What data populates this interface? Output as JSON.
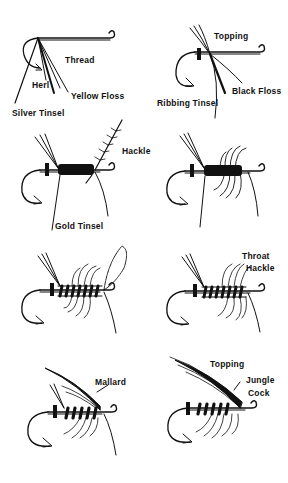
{
  "figure": {
    "ink_color": "#111111",
    "background": "#ffffff"
  },
  "panels": [
    {
      "step": 1,
      "labels": [
        {
          "id": "thread",
          "text": "Thread"
        },
        {
          "id": "herl",
          "text": "Herl"
        },
        {
          "id": "yellow-floss",
          "text": "Yellow Floss"
        },
        {
          "id": "silver-tinsel",
          "text": "Silver Tinsel"
        }
      ]
    },
    {
      "step": 2,
      "labels": [
        {
          "id": "topping",
          "text": "Topping"
        },
        {
          "id": "black-floss",
          "text": "Black Floss"
        },
        {
          "id": "ribbing-tinsel",
          "text": "Ribbing Tinsel"
        }
      ]
    },
    {
      "step": 3,
      "labels": [
        {
          "id": "hackle",
          "text": "Hackle"
        },
        {
          "id": "gold-tinsel",
          "text": "Gold Tinsel"
        }
      ]
    },
    {
      "step": 4,
      "labels": []
    },
    {
      "step": 5,
      "labels": []
    },
    {
      "step": 6,
      "labels": [
        {
          "id": "throat",
          "text": "Throat"
        },
        {
          "id": "hackle",
          "text": "Hackle"
        }
      ]
    },
    {
      "step": 7,
      "labels": [
        {
          "id": "mallard",
          "text": "Mallard"
        }
      ]
    },
    {
      "step": 8,
      "labels": [
        {
          "id": "topping",
          "text": "Topping"
        },
        {
          "id": "jungle",
          "text": "Jungle"
        },
        {
          "id": "cock",
          "text": "Cock"
        }
      ]
    }
  ]
}
